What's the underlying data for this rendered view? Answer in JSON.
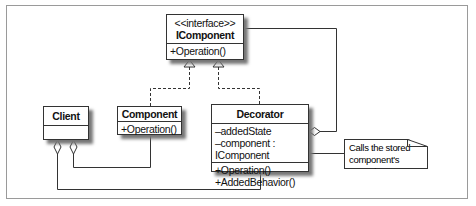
{
  "diagram": {
    "type": "UML class diagram",
    "pattern": "Decorator",
    "classes": {
      "icomponent": {
        "stereotype": "<<interface>>",
        "name": "IComponent",
        "attributes": [],
        "operations": [
          "+Operation()"
        ]
      },
      "client": {
        "name": "Client",
        "attributes": [],
        "operations": []
      },
      "component": {
        "name": "Component",
        "operations": [
          "+Operation()"
        ]
      },
      "decorator": {
        "name": "Decorator",
        "attributes": [
          "–addedState",
          "–component : IComponent"
        ],
        "operations": [
          "+Operation()",
          "+AddedBehavior()"
        ]
      }
    },
    "note": {
      "lines": [
        "Calls the stored",
        "component's operation"
      ]
    },
    "relationships": [
      {
        "from": "Component",
        "to": "IComponent",
        "type": "realization"
      },
      {
        "from": "Decorator",
        "to": "IComponent",
        "type": "realization"
      },
      {
        "from": "Decorator",
        "to": "IComponent",
        "type": "aggregation"
      },
      {
        "from": "Client",
        "to": "Component",
        "type": "aggregation"
      },
      {
        "from": "Client",
        "to": "Decorator",
        "type": "aggregation"
      },
      {
        "from": "Note",
        "to": "Decorator.Operation",
        "type": "note-link"
      }
    ]
  }
}
